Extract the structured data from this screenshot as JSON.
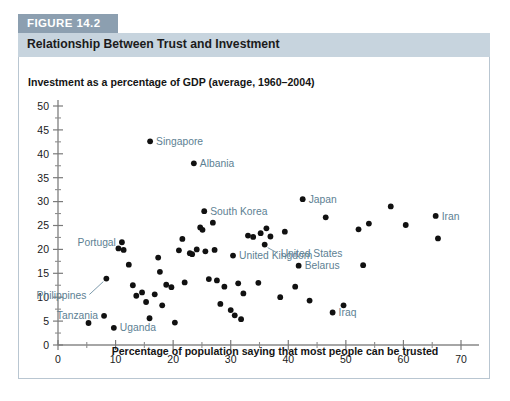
{
  "figure": {
    "tag": "FIGURE 14.2",
    "title": "Relationship Between Trust and Investment"
  },
  "chart_data": {
    "type": "scatter",
    "title": "Relationship Between Trust and Investment",
    "xlabel": "Percentage of population saying that most people can be trusted",
    "ylabel": "Investment as a percentage of GDP (average, 1960–2004)",
    "xlim": [
      0,
      70
    ],
    "ylim": [
      0,
      50
    ],
    "xticks": [
      0,
      10,
      20,
      30,
      40,
      50,
      60,
      70
    ],
    "yticks": [
      0,
      5,
      10,
      15,
      20,
      25,
      30,
      35,
      40,
      45,
      50
    ],
    "x_minor_step": 5,
    "y_minor_step": 2.5,
    "grid": false,
    "legend": "none",
    "marker_color": "#111111",
    "label_color": "#5d7f93",
    "labeled_points": [
      {
        "name": "Singapore",
        "x": 16.0,
        "y": 42.6,
        "label_pos": "right"
      },
      {
        "name": "Albania",
        "x": 23.6,
        "y": 38.0,
        "label_pos": "right"
      },
      {
        "name": "South Korea",
        "x": 25.4,
        "y": 28.0,
        "label_pos": "right"
      },
      {
        "name": "Japan",
        "x": 42.5,
        "y": 30.5,
        "label_pos": "right"
      },
      {
        "name": "Iran",
        "x": 65.6,
        "y": 27.0,
        "label_pos": "right"
      },
      {
        "name": "United States",
        "x": 35.9,
        "y": 21.0,
        "label_pos": "leader-right"
      },
      {
        "name": "United Kingdom",
        "x": 30.4,
        "y": 18.7,
        "label_pos": "right"
      },
      {
        "name": "Belarus",
        "x": 41.8,
        "y": 16.6,
        "label_pos": "right"
      },
      {
        "name": "Iraq",
        "x": 47.7,
        "y": 6.8,
        "label_pos": "right"
      },
      {
        "name": "Portugal",
        "x": 11.1,
        "y": 21.5,
        "label_pos": "left"
      },
      {
        "name": "Philippines",
        "x": 8.4,
        "y": 13.9,
        "label_pos": "leader-left"
      },
      {
        "name": "Tanzania",
        "x": 8.0,
        "y": 6.1,
        "label_pos": "left"
      },
      {
        "name": "Uganda",
        "x": 9.7,
        "y": 3.6,
        "label_pos": "right"
      }
    ],
    "unlabeled_points": [
      {
        "x": 5.3,
        "y": 4.6
      },
      {
        "x": 10.5,
        "y": 20.2
      },
      {
        "x": 11.4,
        "y": 19.9
      },
      {
        "x": 12.3,
        "y": 16.8
      },
      {
        "x": 13.0,
        "y": 12.5
      },
      {
        "x": 13.6,
        "y": 10.3
      },
      {
        "x": 14.6,
        "y": 11.0
      },
      {
        "x": 15.3,
        "y": 9.0
      },
      {
        "x": 15.9,
        "y": 5.6
      },
      {
        "x": 16.8,
        "y": 10.6
      },
      {
        "x": 17.4,
        "y": 18.3
      },
      {
        "x": 17.7,
        "y": 15.3
      },
      {
        "x": 18.1,
        "y": 8.3
      },
      {
        "x": 18.8,
        "y": 12.6
      },
      {
        "x": 19.7,
        "y": 12.1
      },
      {
        "x": 20.3,
        "y": 4.7
      },
      {
        "x": 21.0,
        "y": 19.8
      },
      {
        "x": 21.6,
        "y": 22.2
      },
      {
        "x": 22.0,
        "y": 13.1
      },
      {
        "x": 22.9,
        "y": 19.2
      },
      {
        "x": 23.3,
        "y": 19.0
      },
      {
        "x": 24.1,
        "y": 20.0
      },
      {
        "x": 24.7,
        "y": 24.6
      },
      {
        "x": 25.1,
        "y": 24.1
      },
      {
        "x": 25.6,
        "y": 19.6
      },
      {
        "x": 26.2,
        "y": 13.8
      },
      {
        "x": 26.9,
        "y": 25.6
      },
      {
        "x": 27.2,
        "y": 19.9
      },
      {
        "x": 27.6,
        "y": 13.5
      },
      {
        "x": 28.2,
        "y": 8.6
      },
      {
        "x": 28.9,
        "y": 12.2
      },
      {
        "x": 30.0,
        "y": 7.3
      },
      {
        "x": 30.7,
        "y": 6.2
      },
      {
        "x": 31.3,
        "y": 12.9
      },
      {
        "x": 31.8,
        "y": 5.4
      },
      {
        "x": 32.2,
        "y": 10.8
      },
      {
        "x": 33.0,
        "y": 22.9
      },
      {
        "x": 33.9,
        "y": 22.6
      },
      {
        "x": 34.8,
        "y": 13.0
      },
      {
        "x": 35.2,
        "y": 23.4
      },
      {
        "x": 36.2,
        "y": 24.4
      },
      {
        "x": 36.9,
        "y": 22.7
      },
      {
        "x": 38.6,
        "y": 10.0
      },
      {
        "x": 39.4,
        "y": 23.7
      },
      {
        "x": 41.2,
        "y": 12.2
      },
      {
        "x": 43.7,
        "y": 9.3
      },
      {
        "x": 46.5,
        "y": 26.7
      },
      {
        "x": 49.6,
        "y": 8.3
      },
      {
        "x": 52.2,
        "y": 24.2
      },
      {
        "x": 53.0,
        "y": 16.7
      },
      {
        "x": 54.0,
        "y": 25.4
      },
      {
        "x": 57.8,
        "y": 29.0
      },
      {
        "x": 60.4,
        "y": 25.1
      },
      {
        "x": 66.0,
        "y": 22.3
      }
    ]
  }
}
